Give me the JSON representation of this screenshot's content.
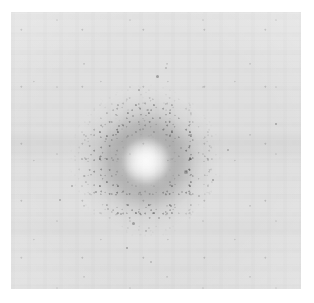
{
  "figure": {
    "kind": "grayscale-scientific-image",
    "canvas": {
      "width_px": 314,
      "height_px": 303,
      "background_color": "#ffffff"
    },
    "panel": {
      "name": "image-plate",
      "left_px": 11,
      "top_px": 12,
      "width_px": 290,
      "height_px": 277,
      "background_color": "#dfdfdf",
      "mean_background_gray": "#e0e0e0",
      "has_border": false
    }
  },
  "chart_data": {
    "type": "heatmap",
    "title": "",
    "subtitle": "",
    "xlabel": "",
    "ylabel": "",
    "colormap": "grayscale",
    "grid": false,
    "legend": "none",
    "axis_visible": false,
    "tick_labels_x": [],
    "tick_labels_y": [],
    "xlim": [
      0,
      290
    ],
    "ylim": [
      0,
      277
    ],
    "value_range_gray": [
      "#9a9a9a",
      "#e6e6e6"
    ],
    "features": [
      {
        "name": "bright-core",
        "center_x_px": 146,
        "center_y_px": 161,
        "radius_px": 16,
        "peak_gray": "#d9d9d9",
        "note": "central intensity maximum, brighter than surrounding annulus"
      },
      {
        "name": "dark-annulus",
        "center_x_px": 146,
        "center_y_px": 161,
        "inner_radius_px": 18,
        "outer_radius_px": 42,
        "peak_radius_px": 30,
        "min_gray": "#9a9a9a",
        "note": "darkest ring of the radial profile"
      },
      {
        "name": "speckle-halo",
        "center_x_px": 146,
        "center_y_px": 161,
        "inner_radius_px": 40,
        "outer_radius_px": 78,
        "note": "granular noisy transition zone, denser below and to the left"
      },
      {
        "name": "upper-plume",
        "center_x_px": 148,
        "center_y_px": 95,
        "width_px": 86,
        "height_px": 70,
        "note": "faint vertical extension of speckle above the blob"
      }
    ],
    "radial_profile": {
      "radius_px": [
        0,
        8,
        16,
        22,
        28,
        34,
        42,
        50,
        60,
        72,
        85,
        100
      ],
      "gray_level": [
        "#d9d9d9",
        "#d5d5d5",
        "#c8c8c8",
        "#b2b2b2",
        "#9f9f9f",
        "#9a9a9a",
        "#a8a8a8",
        "#bfbfbf",
        "#d2d2d2",
        "#dadada",
        "#dedede",
        "#e0e0e0"
      ],
      "note": "azimuthally averaged brightness from the blob center outward"
    },
    "dust_specks": [
      {
        "x_px": 84,
        "y_px": 176,
        "r_px": 1.4
      },
      {
        "x_px": 72,
        "y_px": 186,
        "r_px": 1.1
      },
      {
        "x_px": 96,
        "y_px": 192,
        "r_px": 1.0
      },
      {
        "x_px": 108,
        "y_px": 209,
        "r_px": 1.3
      },
      {
        "x_px": 121,
        "y_px": 214,
        "r_px": 1.1
      },
      {
        "x_px": 133,
        "y_px": 223,
        "r_px": 1.5
      },
      {
        "x_px": 146,
        "y_px": 231,
        "r_px": 1.0
      },
      {
        "x_px": 159,
        "y_px": 218,
        "r_px": 1.2
      },
      {
        "x_px": 171,
        "y_px": 206,
        "r_px": 1.3
      },
      {
        "x_px": 182,
        "y_px": 192,
        "r_px": 1.1
      },
      {
        "x_px": 186,
        "y_px": 172,
        "r_px": 1.6
      },
      {
        "x_px": 190,
        "y_px": 158,
        "r_px": 1.2
      },
      {
        "x_px": 181,
        "y_px": 148,
        "r_px": 1.4
      },
      {
        "x_px": 172,
        "y_px": 131,
        "r_px": 1.0
      },
      {
        "x_px": 160,
        "y_px": 118,
        "r_px": 1.1
      },
      {
        "x_px": 148,
        "y_px": 110,
        "r_px": 0.9
      },
      {
        "x_px": 133,
        "y_px": 116,
        "r_px": 1.2
      },
      {
        "x_px": 119,
        "y_px": 126,
        "r_px": 1.0
      },
      {
        "x_px": 106,
        "y_px": 139,
        "r_px": 1.1
      },
      {
        "x_px": 100,
        "y_px": 157,
        "r_px": 1.3
      },
      {
        "x_px": 157,
        "y_px": 76,
        "r_px": 1.5
      },
      {
        "x_px": 166,
        "y_px": 68,
        "r_px": 1.1
      },
      {
        "x_px": 139,
        "y_px": 90,
        "r_px": 0.9
      },
      {
        "x_px": 127,
        "y_px": 248,
        "r_px": 1.2
      },
      {
        "x_px": 151,
        "y_px": 262,
        "r_px": 1.0
      },
      {
        "x_px": 60,
        "y_px": 200,
        "r_px": 1.0
      },
      {
        "x_px": 213,
        "y_px": 180,
        "r_px": 1.1
      },
      {
        "x_px": 199,
        "y_px": 196,
        "r_px": 0.9
      },
      {
        "x_px": 228,
        "y_px": 150,
        "r_px": 0.9
      },
      {
        "x_px": 276,
        "y_px": 124,
        "r_px": 1.0
      }
    ]
  }
}
